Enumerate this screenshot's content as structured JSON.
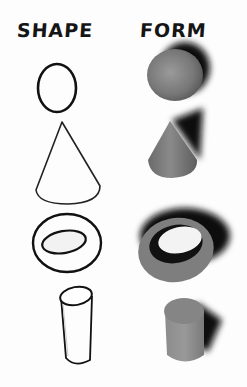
{
  "diagram": {
    "columns": [
      {
        "label": "SHAPE"
      },
      {
        "label": "FORM"
      }
    ],
    "rows": [
      {
        "shape": "oval",
        "form": "sphere"
      },
      {
        "shape": "cone-outline",
        "form": "cone"
      },
      {
        "shape": "ring-outline",
        "form": "torus"
      },
      {
        "shape": "cylinder-outline",
        "form": "cylinder"
      }
    ],
    "colors": {
      "outline": "#111111",
      "form_fill": "#7a7a7a",
      "shadow": "#0e0e0e",
      "background": "#fdfdfd"
    }
  }
}
